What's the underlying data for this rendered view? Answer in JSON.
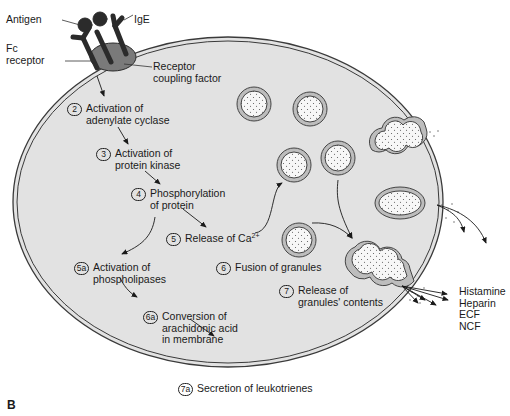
{
  "figure": {
    "panel_label": "B",
    "colors": {
      "cell_fill": "#e2e2e2",
      "membrane": "#4a4a4a",
      "receptor": "#2b2b2b",
      "coupling_factor": "#7a7a7a",
      "granule_fill": "#f7f7f7"
    }
  },
  "labels": {
    "antigen": "Antigen",
    "ige": "IgE",
    "fc_receptor": [
      "Fc",
      "receptor"
    ],
    "receptor_coupling_factor": [
      "Receptor",
      "coupling factor"
    ]
  },
  "steps": [
    {
      "num": "2",
      "lines": [
        "Activation of",
        "adenylate cyclase"
      ]
    },
    {
      "num": "3",
      "lines": [
        "Activation of",
        "protein kinase"
      ]
    },
    {
      "num": "4",
      "lines": [
        "Phosphorylation",
        "of protein"
      ]
    },
    {
      "num": "5",
      "lines": [
        "Release of Ca"
      ],
      "sup": "2+"
    },
    {
      "num": "5a",
      "lines": [
        "Activation of",
        "phospholipases"
      ]
    },
    {
      "num": "6",
      "lines": [
        "Fusion of granules"
      ]
    },
    {
      "num": "6a",
      "lines": [
        "Conversion of",
        "arachidonic acid",
        "in membrane"
      ]
    },
    {
      "num": "7",
      "lines": [
        "Release of",
        "granules' contents"
      ]
    },
    {
      "num": "7a",
      "lines": [
        "Secretion of leukotrienes"
      ]
    }
  ],
  "released_mediators": [
    "Histamine",
    "Heparin",
    "ECF",
    "NCF"
  ]
}
